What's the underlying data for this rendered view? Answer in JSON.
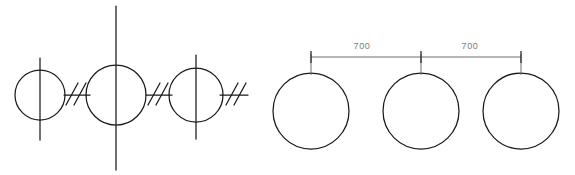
{
  "drawing": {
    "type": "cad-technical-drawing",
    "background_color": "#ffffff",
    "line_color": "#1a1a1a",
    "dimension_color": "#6f6f6f",
    "text_color": "#7b7b7b",
    "views": [
      {
        "name": "left-schematic-view",
        "label": "schematic-elevation",
        "circles": [
          {
            "id": "circle-left",
            "cx": 40,
            "cy": 95,
            "r": 25
          },
          {
            "id": "circle-middle",
            "cx": 116,
            "cy": 95,
            "r": 30
          },
          {
            "id": "circle-right",
            "cx": 196,
            "cy": 95,
            "r": 27
          }
        ],
        "centerlines": [
          {
            "id": "centerline-left",
            "x": 40,
            "y1": 58,
            "y2": 140
          },
          {
            "id": "centerline-middle",
            "x": 116,
            "y1": 6,
            "y2": 170
          },
          {
            "id": "centerline-right",
            "x": 196,
            "y1": 55,
            "y2": 139
          }
        ],
        "connectors": [
          {
            "id": "connector-1",
            "x1": 64,
            "x2": 90,
            "y": 95
          },
          {
            "id": "connector-2",
            "x1": 146,
            "x2": 172,
            "y": 95
          },
          {
            "id": "connector-3",
            "x1": 220,
            "x2": 248,
            "y": 95
          }
        ],
        "break_marks": [
          {
            "id": "break-mark-1",
            "cx": 72,
            "cy": 95
          },
          {
            "id": "break-mark-2",
            "cx": 80,
            "cy": 95
          },
          {
            "id": "break-mark-3",
            "cx": 154,
            "cy": 95
          },
          {
            "id": "break-mark-4",
            "cx": 162,
            "cy": 95
          },
          {
            "id": "break-mark-5",
            "cx": 232,
            "cy": 95
          },
          {
            "id": "break-mark-6",
            "cx": 240,
            "cy": 95
          }
        ]
      },
      {
        "name": "right-plan-view",
        "label": "dimensioned-plan",
        "circles": [
          {
            "id": "plan-circle-1",
            "cx": 311,
            "cy": 111,
            "r": 38
          },
          {
            "id": "plan-circle-2",
            "cx": 421,
            "cy": 111,
            "r": 38
          },
          {
            "id": "plan-circle-3",
            "cx": 521,
            "cy": 111,
            "r": 38
          }
        ],
        "extension_lines": [
          {
            "id": "extension-line-1",
            "x": 311,
            "y1": 54,
            "y2": 75
          },
          {
            "id": "extension-line-2",
            "x": 421,
            "y1": 54,
            "y2": 75
          },
          {
            "id": "extension-line-3",
            "x": 521,
            "y1": 54,
            "y2": 75
          }
        ],
        "dimension_line": {
          "id": "dimension-line",
          "x1": 311,
          "x2": 521,
          "y": 57
        },
        "ticks": [
          {
            "id": "dim-tick-start",
            "x": 311,
            "y1": 50,
            "y2": 64
          },
          {
            "id": "dim-tick-middle",
            "x": 421,
            "y1": 50,
            "y2": 64
          },
          {
            "id": "dim-tick-end",
            "x": 521,
            "y1": 50,
            "y2": 64
          }
        ],
        "dimensions": [
          {
            "id": "dimension-label-1",
            "value": "700",
            "x": 362,
            "y": 49
          },
          {
            "id": "dimension-label-2",
            "value": "700",
            "x": 470,
            "y": 49
          }
        ]
      }
    ]
  }
}
